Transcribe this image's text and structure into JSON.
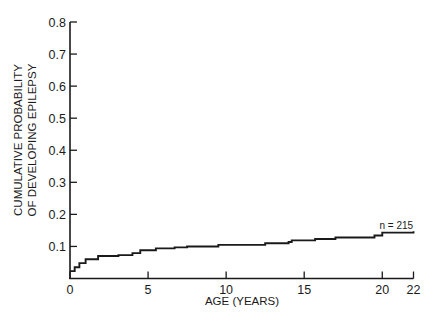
{
  "chart_data": {
    "type": "line",
    "subtype": "step",
    "title": "",
    "xlabel": "AGE (YEARS)",
    "ylabel_lines": [
      "CUMULATIVE PROBABILITY",
      "OF DEVELOPING EPILEPSY"
    ],
    "xlim": [
      0,
      22
    ],
    "ylim": [
      0,
      0.8
    ],
    "x_ticks": [
      0,
      5,
      10,
      15,
      20,
      22
    ],
    "x_tick_labels": [
      "0",
      "5",
      "10",
      "15",
      "20",
      "22"
    ],
    "y_ticks": [
      0.1,
      0.2,
      0.3,
      0.4,
      0.5,
      0.6,
      0.7,
      0.8
    ],
    "y_tick_labels": [
      "0.1",
      "0.2",
      "0.3",
      "0.4",
      "0.5",
      "0.6",
      "0.7",
      "0.8"
    ],
    "grid": false,
    "legend": null,
    "annotations": [
      {
        "text": "n = 215",
        "x": 20.9,
        "y": 0.155
      }
    ],
    "series": [
      {
        "name": "Cumulative probability",
        "x": [
          0,
          0.3,
          0.6,
          1.0,
          1.8,
          3.1,
          4.0,
          4.5,
          5.5,
          6.7,
          7.5,
          9.5,
          12.5,
          14.0,
          14.2,
          15.7,
          17.0,
          19.5,
          20.0,
          22.0
        ],
        "y": [
          0.023,
          0.035,
          0.048,
          0.06,
          0.07,
          0.073,
          0.079,
          0.088,
          0.094,
          0.097,
          0.1,
          0.105,
          0.11,
          0.114,
          0.119,
          0.123,
          0.128,
          0.134,
          0.143,
          0.147
        ]
      }
    ],
    "colors": {
      "line": "#1a1a1a",
      "axis": "#1a1a1a",
      "background": "#ffffff"
    }
  }
}
